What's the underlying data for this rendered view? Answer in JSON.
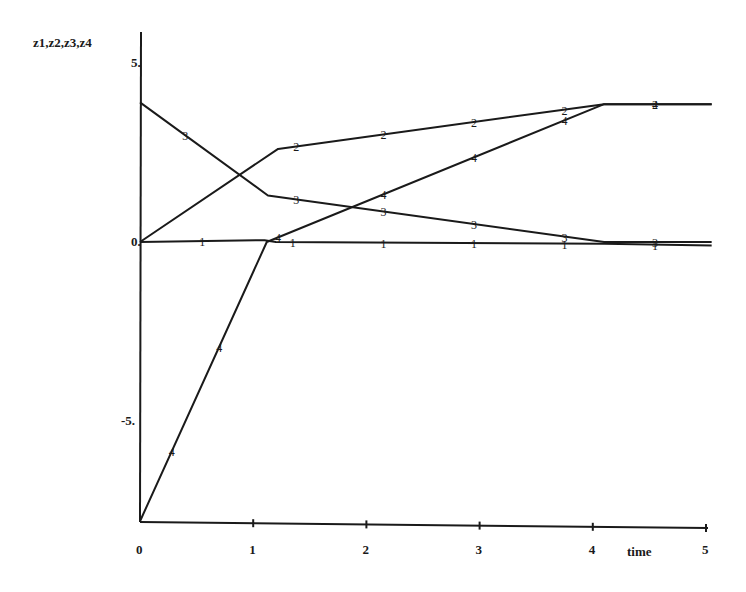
{
  "chart_data": {
    "type": "line",
    "title": "",
    "xlabel": "time",
    "ylabel": "z1,z2,z3,z4",
    "xlim": [
      0,
      5
    ],
    "ylim": [
      -7.8,
      5.5
    ],
    "grid": false,
    "legend": "none (series identified by numeric markers 1-4 along each line)",
    "x_ticks": [
      "0",
      "1",
      "2",
      "3",
      "4",
      "5"
    ],
    "y_ticks": [
      "5.",
      "0.",
      "-5."
    ],
    "series": [
      {
        "name": "z1",
        "marker": "1",
        "x": [
          0,
          1.1,
          1.2,
          4.1,
          5.05
        ],
        "y": [
          0,
          0.05,
          0,
          -0.05,
          -0.1
        ],
        "marker_x": [
          0.55,
          1.35,
          2.15,
          2.95,
          3.75,
          4.55
        ]
      },
      {
        "name": "z2",
        "marker": "2",
        "x": [
          0,
          1.22,
          4.1,
          5.05
        ],
        "y": [
          0,
          2.6,
          3.85,
          3.85
        ],
        "marker_x": [
          1.38,
          2.15,
          2.95,
          3.75,
          4.55
        ]
      },
      {
        "name": "z3",
        "marker": "3",
        "x": [
          0,
          1.13,
          4.1,
          5.05
        ],
        "y": [
          3.9,
          1.3,
          0,
          0
        ],
        "marker_x": [
          0.4,
          1.38,
          2.15,
          2.95,
          3.75,
          4.55
        ]
      },
      {
        "name": "z4",
        "marker": "4",
        "x": [
          0,
          1.12,
          4.1,
          5.05
        ],
        "y": [
          -7.8,
          0,
          3.85,
          3.85
        ],
        "marker_x": [
          0.28,
          0.7,
          1.22,
          2.15,
          2.95,
          3.75,
          4.55
        ]
      }
    ]
  }
}
